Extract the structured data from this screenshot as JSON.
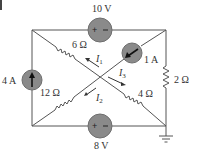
{
  "figure": {
    "type": "circuit",
    "colors": {
      "wire": "#555555",
      "source_fill": "#8a8a8a",
      "source_edge": "#6e6e6e",
      "text": "#333333"
    },
    "edge_mark": {
      "visible": true
    }
  },
  "sources": {
    "v_top": {
      "label": "10 V",
      "kind": "voltage",
      "polarity": "+ -"
    },
    "v_bottom": {
      "label": "8 V",
      "kind": "voltage",
      "polarity": "+ -"
    },
    "i_left": {
      "label": "4 A",
      "kind": "current",
      "direction": "up"
    },
    "i_diag": {
      "label": "1 A",
      "kind": "current",
      "direction": "down-left"
    }
  },
  "resistors": {
    "r6": {
      "label": "6 Ω"
    },
    "r12": {
      "label": "12 Ω"
    },
    "r4": {
      "label": "4 Ω"
    },
    "r2": {
      "label": "2 Ω"
    }
  },
  "currents": {
    "i1": {
      "symbol": "I",
      "sub": "1"
    },
    "i2": {
      "symbol": "I",
      "sub": "2"
    },
    "i3": {
      "symbol": "I",
      "sub": "3"
    }
  },
  "ground": {
    "label": "ground"
  }
}
